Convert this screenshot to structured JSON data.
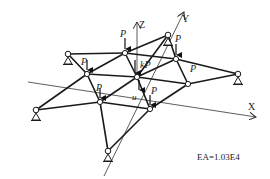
{
  "diagram": {
    "colors": {
      "member": "#1a1a1a",
      "axis": "#333333",
      "node_fill": "#ffffff",
      "background": "#ffffff"
    },
    "axes": {
      "x_label": "X",
      "y_label": "Y",
      "z_label": "Z"
    },
    "annotation": "EA=1.03E4",
    "displacement_label": "u",
    "loads": {
      "p": "P",
      "kp": "kP"
    },
    "nodes": [
      {
        "id": "n1",
        "x": 68,
        "y": 54,
        "support": true
      },
      {
        "id": "n2",
        "x": 125,
        "y": 53,
        "support": false,
        "load": "P"
      },
      {
        "id": "n3",
        "x": 168,
        "y": 35,
        "support": true
      },
      {
        "id": "n4",
        "x": 176,
        "y": 59,
        "support": false,
        "load": "P"
      },
      {
        "id": "n5",
        "x": 238,
        "y": 74,
        "support": true
      },
      {
        "id": "n6",
        "x": 87,
        "y": 74,
        "support": false,
        "load": "P"
      },
      {
        "id": "n7",
        "x": 137,
        "y": 77,
        "support": false,
        "load": "kP"
      },
      {
        "id": "n8",
        "x": 188,
        "y": 84,
        "support": false,
        "load": "P"
      },
      {
        "id": "n9",
        "x": 100,
        "y": 102,
        "support": false,
        "load": "P"
      },
      {
        "id": "n10",
        "x": 150,
        "y": 109,
        "support": false,
        "load": "P"
      },
      {
        "id": "n11",
        "x": 36,
        "y": 110,
        "support": true
      },
      {
        "id": "n12",
        "x": 108,
        "y": 151,
        "support": true
      }
    ],
    "members": [
      [
        "n1",
        "n2"
      ],
      [
        "n2",
        "n3"
      ],
      [
        "n3",
        "n4"
      ],
      [
        "n4",
        "n5"
      ],
      [
        "n1",
        "n6"
      ],
      [
        "n2",
        "n6"
      ],
      [
        "n2",
        "n7"
      ],
      [
        "n3",
        "n7"
      ],
      [
        "n4",
        "n7"
      ],
      [
        "n4",
        "n8"
      ],
      [
        "n5",
        "n8"
      ],
      [
        "n6",
        "n7"
      ],
      [
        "n7",
        "n8"
      ],
      [
        "n6",
        "n9"
      ],
      [
        "n6",
        "n11"
      ],
      [
        "n7",
        "n9"
      ],
      [
        "n7",
        "n10"
      ],
      [
        "n8",
        "n10"
      ],
      [
        "n9",
        "n11"
      ],
      [
        "n9",
        "n10"
      ],
      [
        "n9",
        "n12"
      ],
      [
        "n10",
        "n12"
      ],
      [
        "n2",
        "n4"
      ]
    ]
  }
}
